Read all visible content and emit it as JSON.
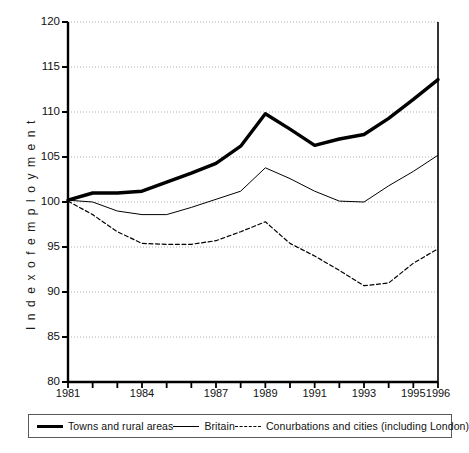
{
  "chart_data": {
    "type": "line",
    "title": "",
    "subtitle": "",
    "xlabel": "",
    "ylabel": "I n d e x   o f   e m p l o y m e n t",
    "ylabel_plain": "Index of employment",
    "xlim": [
      1981,
      1996
    ],
    "ylim": [
      80,
      120
    ],
    "grid": true,
    "grid_axis": "y",
    "legend_position": "bottom",
    "x": [
      1981,
      1982,
      1983,
      1984,
      1985,
      1986,
      1987,
      1988,
      1989,
      1990,
      1991,
      1992,
      1993,
      1994,
      1995,
      1996
    ],
    "y_ticks": [
      80,
      85,
      90,
      95,
      100,
      105,
      110,
      115,
      120
    ],
    "x_ticks": [
      1981,
      1982,
      1983,
      1984,
      1985,
      1986,
      1987,
      1988,
      1989,
      1990,
      1991,
      1992,
      1993,
      1994,
      1995,
      1996
    ],
    "x_tick_labels_shown": [
      "1981",
      "1984",
      "1987",
      "1989",
      "1991",
      "1993",
      "1995",
      "1996"
    ],
    "series": [
      {
        "name": "Towns and rural areas",
        "style": "thick-solid",
        "color": "#000000",
        "values": [
          100.2,
          101.0,
          101.0,
          101.2,
          102.2,
          103.2,
          104.3,
          106.2,
          109.8,
          108.1,
          106.3,
          107.0,
          107.5,
          109.3,
          111.4,
          113.6
        ]
      },
      {
        "name": "Britain",
        "style": "thin-solid",
        "color": "#000000",
        "values": [
          100.2,
          100.0,
          99.0,
          98.6,
          98.6,
          99.4,
          100.3,
          101.2,
          103.8,
          102.6,
          101.2,
          100.1,
          100.0,
          101.8,
          103.4,
          105.2
        ]
      },
      {
        "name": "Conurbations and cities (including London)",
        "style": "dashed",
        "color": "#000000",
        "values": [
          100.1,
          98.6,
          96.7,
          95.4,
          95.3,
          95.3,
          95.7,
          96.7,
          97.8,
          95.4,
          94.0,
          92.4,
          90.7,
          91.0,
          93.2,
          94.8
        ]
      }
    ]
  },
  "legend": {
    "items": [
      {
        "label": "Towns and rural areas",
        "style": "thick-solid"
      },
      {
        "label": "Britain",
        "style": "thin-solid"
      },
      {
        "label": "Conurbations and cities (including London)",
        "style": "dashed"
      }
    ]
  }
}
